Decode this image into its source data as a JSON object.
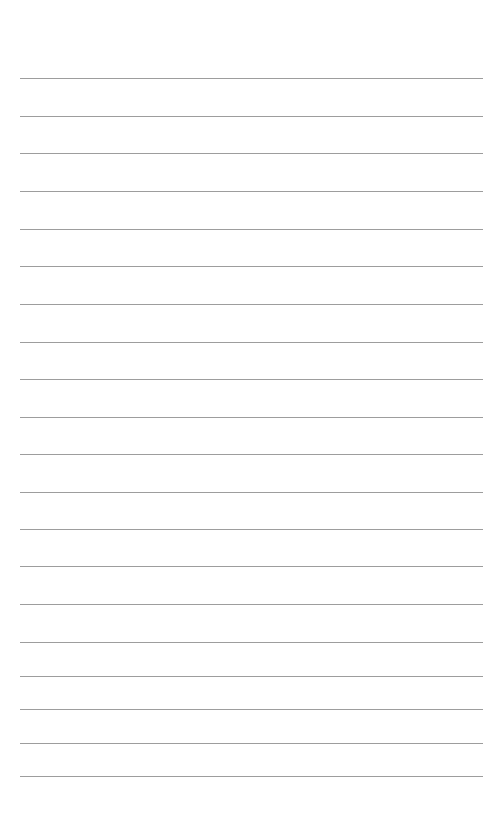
{
  "page": {
    "type": "lined-paper",
    "background": "#ffffff",
    "rule_color": "#8c8c8c",
    "rule_count": 20,
    "rules_y": [
      78,
      115.5,
      153,
      191,
      228.5,
      266,
      304,
      341.5,
      379,
      416.5,
      454,
      491.5,
      529,
      566,
      604,
      641.5,
      675.5,
      709,
      742.5,
      776
    ]
  }
}
